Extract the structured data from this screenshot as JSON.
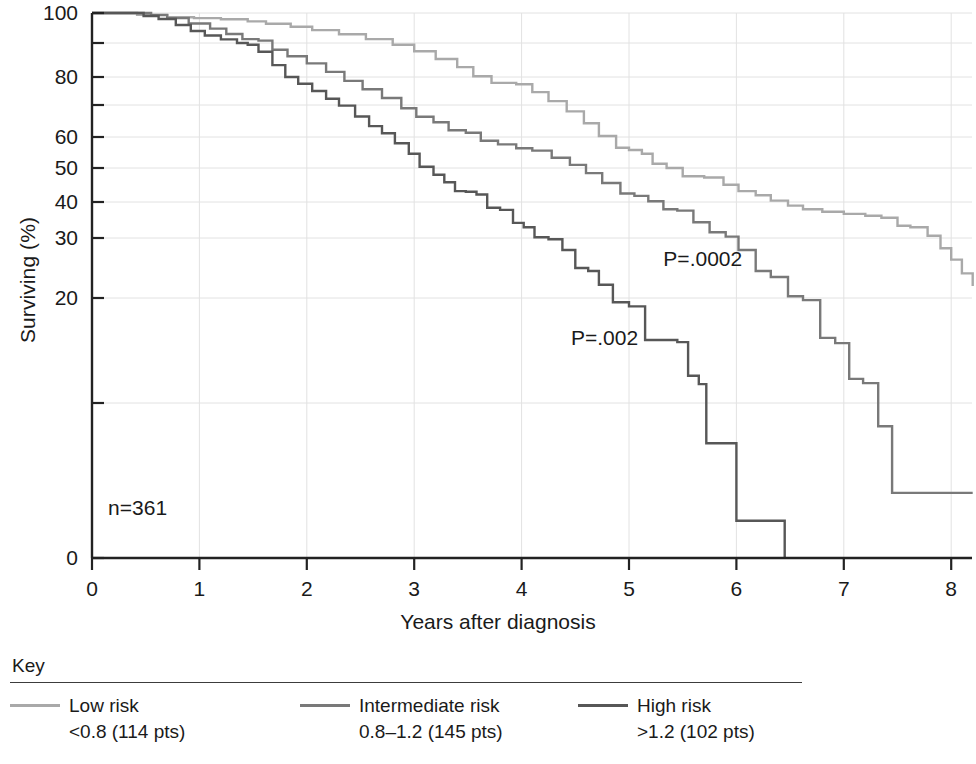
{
  "chart_data": {
    "type": "line",
    "chart_kind": "kaplan-meier-survival",
    "title": "",
    "xlabel": "Years after diagnosis",
    "ylabel": "Surviving (%)",
    "xlim": [
      0,
      8.2
    ],
    "ylim": [
      0,
      100
    ],
    "grid": true,
    "x_ticks": [
      0,
      1,
      2,
      3,
      4,
      5,
      6,
      7,
      8
    ],
    "x_tick_labels": [
      "0",
      "1",
      "2",
      "3",
      "4",
      "5",
      "6",
      "7",
      "8"
    ],
    "y_ticks": [
      0,
      20,
      30,
      40,
      50,
      60,
      80,
      100
    ],
    "y_tick_labels": [
      "0",
      "20",
      "30",
      "40",
      "50",
      "60",
      "80",
      "100"
    ],
    "y_minor_ticks": [
      10,
      70,
      90
    ],
    "y_scale_note": "non-linear (logit-like) survival axis",
    "legend_position": "below-plot",
    "annotations": [
      {
        "id": "n-total",
        "text": "n=361",
        "x": 0.15,
        "y": 3.2
      },
      {
        "id": "p-value-intermediate",
        "text": "P=.0002",
        "x": 5.32,
        "y": 26.5
      },
      {
        "id": "p-value-high",
        "text": "P=.002",
        "x": 4.46,
        "y": 16.2
      }
    ],
    "series": [
      {
        "name": "Low risk",
        "detail": "<0.8 (114 pts)",
        "color": "#a9a9a9",
        "n_patients": 114,
        "points": [
          [
            0.0,
            100.0
          ],
          [
            0.3,
            100.0
          ],
          [
            0.42,
            99.4
          ],
          [
            0.62,
            99.4
          ],
          [
            0.7,
            98.6
          ],
          [
            0.95,
            98.3
          ],
          [
            1.2,
            97.9
          ],
          [
            1.45,
            97.2
          ],
          [
            1.62,
            96.4
          ],
          [
            1.85,
            95.4
          ],
          [
            2.05,
            94.3
          ],
          [
            2.3,
            92.9
          ],
          [
            2.55,
            91.3
          ],
          [
            2.8,
            89.5
          ],
          [
            3.0,
            87.6
          ],
          [
            3.2,
            85.3
          ],
          [
            3.4,
            82.9
          ],
          [
            3.55,
            80.2
          ],
          [
            3.72,
            77.9
          ],
          [
            3.95,
            77.4
          ],
          [
            4.1,
            74.6
          ],
          [
            4.25,
            71.4
          ],
          [
            4.42,
            68.0
          ],
          [
            4.58,
            64.3
          ],
          [
            4.72,
            60.3
          ],
          [
            4.88,
            56.5
          ],
          [
            5.0,
            55.8
          ],
          [
            5.12,
            54.6
          ],
          [
            5.22,
            51.4
          ],
          [
            5.35,
            50.0
          ],
          [
            5.5,
            47.6
          ],
          [
            5.7,
            47.2
          ],
          [
            5.88,
            45.1
          ],
          [
            6.02,
            43.2
          ],
          [
            6.18,
            42.0
          ],
          [
            6.32,
            40.4
          ],
          [
            6.48,
            39.0
          ],
          [
            6.62,
            38.0
          ],
          [
            6.8,
            37.3
          ],
          [
            7.0,
            36.7
          ],
          [
            7.2,
            36.2
          ],
          [
            7.35,
            35.6
          ],
          [
            7.5,
            33.4
          ],
          [
            7.62,
            33.0
          ],
          [
            7.78,
            30.6
          ],
          [
            7.9,
            28.3
          ],
          [
            8.0,
            26.4
          ],
          [
            8.1,
            24.1
          ],
          [
            8.2,
            22.0
          ]
        ]
      },
      {
        "name": "Intermediate risk",
        "detail": "0.8–1.2 (145 pts)",
        "color": "#797979",
        "n_patients": 145,
        "points": [
          [
            0.0,
            100.0
          ],
          [
            0.35,
            100.0
          ],
          [
            0.55,
            99.3
          ],
          [
            0.7,
            98.3
          ],
          [
            0.9,
            96.5
          ],
          [
            1.1,
            94.8
          ],
          [
            1.25,
            93.0
          ],
          [
            1.4,
            91.3
          ],
          [
            1.55,
            90.8
          ],
          [
            1.68,
            88.0
          ],
          [
            1.82,
            86.1
          ],
          [
            2.0,
            84.0
          ],
          [
            2.18,
            81.5
          ],
          [
            2.35,
            78.6
          ],
          [
            2.52,
            75.6
          ],
          [
            2.7,
            72.5
          ],
          [
            2.88,
            69.0
          ],
          [
            3.02,
            66.3
          ],
          [
            3.18,
            64.6
          ],
          [
            3.32,
            62.1
          ],
          [
            3.48,
            61.3
          ],
          [
            3.62,
            58.8
          ],
          [
            3.78,
            57.6
          ],
          [
            3.95,
            56.4
          ],
          [
            4.1,
            55.6
          ],
          [
            4.28,
            53.3
          ],
          [
            4.45,
            51.0
          ],
          [
            4.6,
            48.5
          ],
          [
            4.75,
            45.6
          ],
          [
            4.92,
            42.5
          ],
          [
            5.05,
            41.8
          ],
          [
            5.18,
            40.2
          ],
          [
            5.32,
            38.0
          ],
          [
            5.45,
            37.6
          ],
          [
            5.6,
            34.4
          ],
          [
            5.75,
            31.6
          ],
          [
            5.9,
            30.4
          ],
          [
            6.02,
            28.0
          ],
          [
            6.18,
            24.5
          ],
          [
            6.32,
            23.5
          ],
          [
            6.48,
            20.3
          ],
          [
            6.62,
            19.8
          ],
          [
            6.78,
            16.2
          ],
          [
            6.92,
            15.7
          ],
          [
            7.05,
            12.3
          ],
          [
            7.18,
            11.9
          ],
          [
            7.32,
            8.5
          ],
          [
            7.45,
            4.2
          ],
          [
            8.2,
            4.2
          ]
        ]
      },
      {
        "name": "High risk",
        "detail": ">1.2 (102 pts)",
        "color": "#575757",
        "n_patients": 102,
        "points": [
          [
            0.0,
            100.0
          ],
          [
            0.32,
            100.0
          ],
          [
            0.48,
            99.0
          ],
          [
            0.62,
            98.0
          ],
          [
            0.78,
            96.0
          ],
          [
            0.92,
            94.0
          ],
          [
            1.05,
            92.5
          ],
          [
            1.2,
            91.2
          ],
          [
            1.35,
            90.0
          ],
          [
            1.45,
            89.5
          ],
          [
            1.55,
            87.4
          ],
          [
            1.68,
            83.5
          ],
          [
            1.8,
            80.0
          ],
          [
            1.92,
            77.6
          ],
          [
            2.05,
            75.0
          ],
          [
            2.18,
            72.2
          ],
          [
            2.3,
            69.8
          ],
          [
            2.45,
            66.4
          ],
          [
            2.58,
            63.4
          ],
          [
            2.7,
            61.2
          ],
          [
            2.82,
            58.0
          ],
          [
            2.95,
            54.6
          ],
          [
            3.05,
            50.4
          ],
          [
            3.18,
            48.0
          ],
          [
            3.28,
            45.8
          ],
          [
            3.38,
            43.2
          ],
          [
            3.48,
            43.0
          ],
          [
            3.58,
            42.2
          ],
          [
            3.68,
            38.4
          ],
          [
            3.8,
            37.8
          ],
          [
            3.92,
            34.2
          ],
          [
            4.02,
            33.0
          ],
          [
            4.12,
            30.2
          ],
          [
            4.25,
            29.8
          ],
          [
            4.38,
            28.0
          ],
          [
            4.5,
            25.0
          ],
          [
            4.62,
            24.5
          ],
          [
            4.72,
            22.2
          ],
          [
            4.85,
            19.6
          ],
          [
            5.0,
            19.2
          ],
          [
            5.15,
            16.0
          ],
          [
            5.45,
            15.8
          ],
          [
            5.55,
            12.6
          ],
          [
            5.65,
            11.8
          ],
          [
            5.72,
            7.4
          ],
          [
            6.0,
            7.2
          ],
          [
            6.0,
            2.4
          ],
          [
            6.45,
            2.4
          ],
          [
            6.45,
            0.0
          ]
        ]
      }
    ]
  },
  "axes": {
    "y_title": "Surviving (%)",
    "x_title": "Years after diagnosis"
  },
  "legend": {
    "title": "Key",
    "entries": [
      {
        "label": "Low risk",
        "sub": "<0.8 (114 pts)",
        "color": "#a9a9a9"
      },
      {
        "label": "Intermediate risk",
        "sub": "0.8–1.2 (145 pts)",
        "color": "#797979"
      },
      {
        "label": "High risk",
        "sub": ">1.2 (102 pts)",
        "color": "#575757"
      }
    ]
  },
  "annotations": {
    "sample_size": "n=361",
    "p_intermediate": "P=.0002",
    "p_high": "P=.002"
  },
  "colors": {
    "axis": "#222222",
    "grid": "#e2e2e2",
    "text": "#1a1a1a",
    "low_risk": "#a9a9a9",
    "intermediate_risk": "#797979",
    "high_risk": "#575757"
  }
}
